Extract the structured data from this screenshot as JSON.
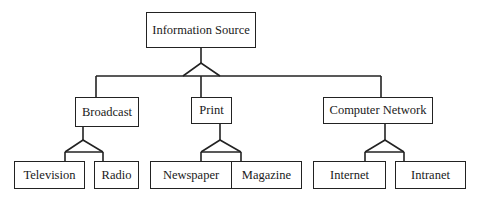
{
  "diagram": {
    "type": "hierarchy",
    "root": {
      "label": "Information Source"
    },
    "categories": [
      {
        "label": "Broadcast",
        "children": [
          {
            "label": "Television"
          },
          {
            "label": "Radio"
          }
        ]
      },
      {
        "label": "Print",
        "children": [
          {
            "label": "Newspaper"
          },
          {
            "label": "Magazine"
          }
        ]
      },
      {
        "label": "Computer Network",
        "children": [
          {
            "label": "Internet"
          },
          {
            "label": "Intranet"
          }
        ]
      }
    ],
    "colors": {
      "line": "#222222",
      "background": "#ffffff",
      "text": "#1a1a1a"
    }
  }
}
